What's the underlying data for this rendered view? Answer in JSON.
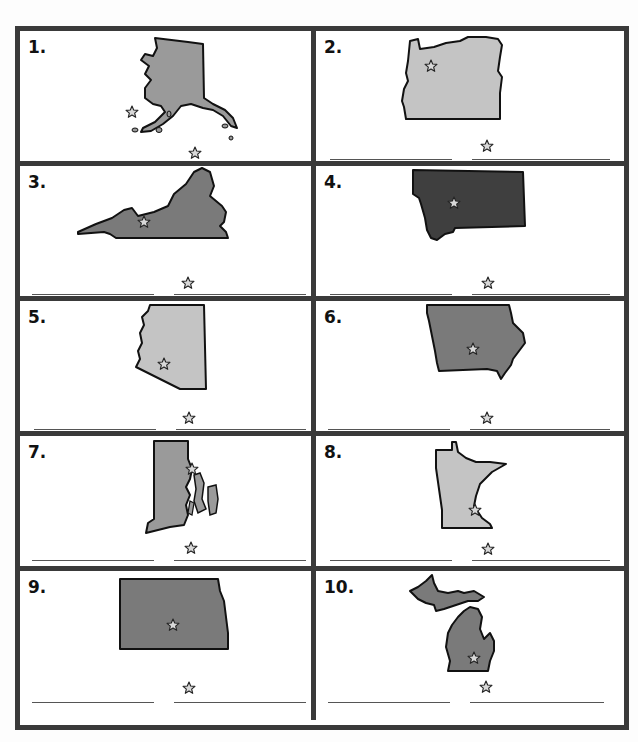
{
  "worksheet": {
    "colors": {
      "border": "#3a3a3a",
      "light_fill": "#c4c4c4",
      "medium_fill": "#9a9a9a",
      "dark_fill": "#7a7a7a",
      "darkest_fill": "#3f3f3f",
      "outline": "#111111",
      "star_fill": "#d8d8d8"
    },
    "items": [
      {
        "number": "1.",
        "state_shape": "alaska",
        "fill": "medium",
        "capital_star": true,
        "answer_lines": 2
      },
      {
        "number": "2.",
        "state_shape": "oregon",
        "fill": "light",
        "capital_star": true,
        "answer_lines": 2
      },
      {
        "number": "3.",
        "state_shape": "virginia",
        "fill": "dark",
        "capital_star": true,
        "answer_lines": 2
      },
      {
        "number": "4.",
        "state_shape": "montana",
        "fill": "darkest",
        "capital_star": true,
        "answer_lines": 2
      },
      {
        "number": "5.",
        "state_shape": "arizona",
        "fill": "light",
        "capital_star": true,
        "answer_lines": 2
      },
      {
        "number": "6.",
        "state_shape": "iowa",
        "fill": "dark",
        "capital_star": true,
        "answer_lines": 2
      },
      {
        "number": "7.",
        "state_shape": "rhode-island",
        "fill": "medium",
        "capital_star": true,
        "answer_lines": 2
      },
      {
        "number": "8.",
        "state_shape": "minnesota",
        "fill": "light",
        "capital_star": true,
        "answer_lines": 2
      },
      {
        "number": "9.",
        "state_shape": "north-dakota",
        "fill": "dark",
        "capital_star": true,
        "answer_lines": 2
      },
      {
        "number": "10.",
        "state_shape": "michigan",
        "fill": "dark",
        "capital_star": true,
        "answer_lines": 2
      }
    ]
  }
}
